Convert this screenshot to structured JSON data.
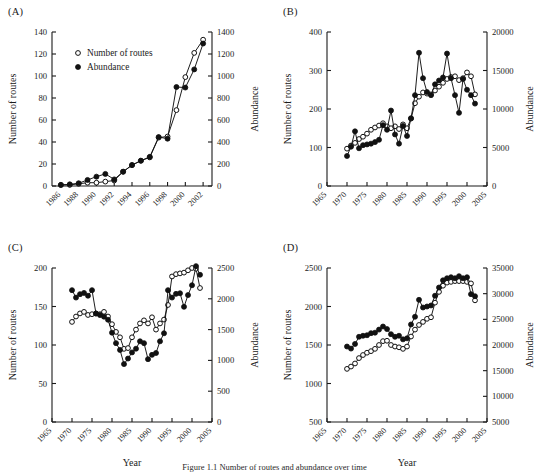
{
  "figure": {
    "caption_fragment": "Figure 1.1  Number of routes and abundance over time",
    "legend": {
      "routes_label": "Number of routes",
      "abundance_label": "Abundance",
      "routes_marker": "open-circle",
      "abundance_marker": "filled-circle"
    },
    "axis_titles": {
      "x": "Year",
      "y_left": "Number of routes",
      "y_right": "Abundance"
    }
  },
  "chart_data": [
    {
      "panel": "(A)",
      "type": "line",
      "title": "",
      "xlabel": "Year",
      "ylabel": "Number of routes",
      "y2label": "Abundance",
      "xlim": [
        1985,
        2003
      ],
      "ylim": [
        0,
        140
      ],
      "y2lim": [
        0,
        1400
      ],
      "xticks": [
        1986,
        1988,
        1990,
        1992,
        1994,
        1996,
        1998,
        2000,
        2002
      ],
      "yticks": [
        0,
        20,
        40,
        60,
        80,
        100,
        120,
        140
      ],
      "y2ticks": [
        0,
        200,
        400,
        600,
        800,
        1000,
        1200,
        1400
      ],
      "grid": false,
      "legend_position": "upper-left",
      "x": [
        1986,
        1987,
        1988,
        1989,
        1990,
        1991,
        1992,
        1993,
        1994,
        1995,
        1996,
        1997,
        1998,
        1999,
        2000,
        2001,
        2002
      ],
      "series": [
        {
          "name": "Number of routes",
          "marker": "open-circle",
          "axis": "left",
          "values": [
            1,
            1,
            2,
            3,
            3,
            4,
            5,
            13,
            19,
            23,
            26,
            44,
            45,
            69,
            99,
            121,
            133
          ]
        },
        {
          "name": "Abundance",
          "marker": "filled-circle",
          "axis": "right",
          "values": [
            10,
            15,
            25,
            55,
            85,
            110,
            60,
            130,
            190,
            230,
            265,
            445,
            430,
            900,
            895,
            1060,
            1295
          ]
        }
      ]
    },
    {
      "panel": "(B)",
      "type": "line",
      "title": "",
      "xlabel": "Year",
      "ylabel": "Number of routes",
      "y2label": "Abundance",
      "xlim": [
        1965,
        2005
      ],
      "ylim": [
        0,
        400
      ],
      "y2lim": [
        0,
        20000
      ],
      "xticks": [
        1965,
        1970,
        1975,
        1980,
        1985,
        1990,
        1995,
        2000,
        2005
      ],
      "yticks": [
        0,
        100,
        200,
        300,
        400
      ],
      "y2ticks": [
        0,
        5000,
        10000,
        15000,
        20000
      ],
      "grid": false,
      "legend_position": "none",
      "x": [
        1970,
        1971,
        1972,
        1973,
        1974,
        1975,
        1976,
        1977,
        1978,
        1979,
        1980,
        1981,
        1982,
        1983,
        1984,
        1985,
        1986,
        1987,
        1988,
        1989,
        1990,
        1991,
        1992,
        1993,
        1994,
        1995,
        1996,
        1997,
        1998,
        1999,
        2000,
        2001,
        2002
      ],
      "series": [
        {
          "name": "Number of routes",
          "marker": "open-circle",
          "axis": "left",
          "values": [
            97,
            105,
            112,
            122,
            128,
            136,
            146,
            152,
            157,
            163,
            155,
            150,
            155,
            148,
            160,
            150,
            175,
            215,
            232,
            243,
            240,
            238,
            248,
            258,
            268,
            278,
            283,
            285,
            275,
            280,
            295,
            285,
            238
          ]
        },
        {
          "name": "Abundance",
          "marker": "filled-circle",
          "axis": "right",
          "values": [
            3900,
            5100,
            7100,
            4900,
            5300,
            5400,
            5500,
            5700,
            6000,
            7900,
            7300,
            9800,
            6700,
            5500,
            7800,
            6500,
            8800,
            11800,
            17300,
            14000,
            12200,
            11800,
            13200,
            13700,
            14100,
            17200,
            14000,
            11800,
            9500,
            13900,
            12500,
            11800,
            10700
          ]
        }
      ]
    },
    {
      "panel": "(C)",
      "type": "line",
      "title": "",
      "xlabel": "Year",
      "ylabel": "Number of routes",
      "y2label": "Abundance",
      "xlim": [
        1965,
        2005
      ],
      "ylim": [
        0,
        200
      ],
      "y2lim": [
        0,
        2500
      ],
      "xticks": [
        1965,
        1970,
        1975,
        1980,
        1985,
        1990,
        1995,
        2000,
        2005
      ],
      "yticks": [
        0,
        50,
        100,
        150,
        200
      ],
      "y2ticks": [
        0,
        500,
        1000,
        1500,
        2000,
        2500
      ],
      "grid": false,
      "legend_position": "none",
      "x": [
        1970,
        1971,
        1972,
        1973,
        1974,
        1975,
        1976,
        1977,
        1978,
        1979,
        1980,
        1981,
        1982,
        1983,
        1984,
        1985,
        1986,
        1987,
        1988,
        1989,
        1990,
        1991,
        1992,
        1993,
        1994,
        1995,
        1996,
        1997,
        1998,
        1999,
        2000,
        2001,
        2002
      ],
      "series": [
        {
          "name": "Number of routes",
          "marker": "open-circle",
          "axis": "left",
          "values": [
            130,
            137,
            141,
            143,
            139,
            140,
            141,
            140,
            143,
            137,
            127,
            117,
            110,
            95,
            96,
            110,
            120,
            128,
            132,
            128,
            136,
            120,
            128,
            133,
            152,
            189,
            192,
            193,
            194,
            197,
            200,
            199,
            174
          ]
        },
        {
          "name": "Abundance",
          "marker": "filled-circle",
          "axis": "right",
          "values": [
            2140,
            2020,
            2075,
            2095,
            2050,
            2140,
            1760,
            1735,
            1710,
            1660,
            1450,
            1280,
            1170,
            940,
            1030,
            1130,
            1190,
            1310,
            1280,
            1020,
            1090,
            1120,
            1310,
            1440,
            2140,
            2020,
            2080,
            2090,
            1870,
            2060,
            2220,
            2530,
            2390
          ]
        }
      ]
    },
    {
      "panel": "(D)",
      "type": "line",
      "title": "",
      "xlabel": "Year",
      "ylabel": "Number of routes",
      "y2label": "Abundance",
      "xlim": [
        1965,
        2005
      ],
      "ylim": [
        500,
        2500
      ],
      "y2lim": [
        5000,
        35000
      ],
      "xticks": [
        1965,
        1970,
        1975,
        1980,
        1985,
        1990,
        1995,
        2000,
        2005
      ],
      "yticks": [
        500,
        1000,
        1500,
        2000,
        2500
      ],
      "y2ticks": [
        5000,
        10000,
        15000,
        20000,
        25000,
        30000,
        35000
      ],
      "grid": false,
      "legend_position": "none",
      "x": [
        1970,
        1971,
        1972,
        1973,
        1974,
        1975,
        1976,
        1977,
        1978,
        1979,
        1980,
        1981,
        1982,
        1983,
        1984,
        1985,
        1986,
        1987,
        1988,
        1989,
        1990,
        1991,
        1992,
        1993,
        1994,
        1995,
        1996,
        1997,
        1998,
        1999,
        2000,
        2001,
        2002
      ],
      "series": [
        {
          "name": "Number of routes",
          "marker": "open-circle",
          "axis": "left",
          "values": [
            1190,
            1220,
            1260,
            1330,
            1370,
            1400,
            1420,
            1450,
            1500,
            1550,
            1555,
            1500,
            1480,
            1470,
            1450,
            1480,
            1610,
            1700,
            1760,
            1800,
            1840,
            1860,
            2050,
            2190,
            2270,
            2310,
            2320,
            2330,
            2330,
            2330,
            2320,
            2300,
            2080
          ]
        },
        {
          "name": "Abundance",
          "marker": "filled-circle",
          "axis": "right",
          "values": [
            19700,
            19300,
            20200,
            21600,
            21800,
            21900,
            22300,
            22400,
            23000,
            23600,
            23100,
            22100,
            21600,
            21800,
            21100,
            21300,
            24000,
            25500,
            28800,
            27300,
            27500,
            27700,
            29600,
            31200,
            32600,
            33000,
            33200,
            33000,
            33400,
            33000,
            33200,
            29900,
            29500
          ]
        }
      ]
    }
  ]
}
